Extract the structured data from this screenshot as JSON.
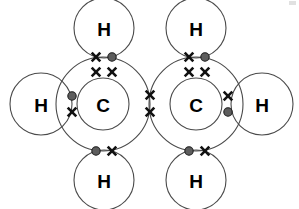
{
  "diagram": {
    "type": "dot-and-cross-covalent-bonding",
    "molecule_formula": "C2H4",
    "background_color": "#ffffff",
    "shell_stroke_color": "#4a4a4a",
    "dot_fill_color": "#5d5d5d",
    "dot_stroke_color": "#1c1c1c",
    "cross_color": "#111111",
    "label_color": "#000000",
    "atoms": [
      {
        "id": "h-top-left",
        "element": "H",
        "label": "H",
        "cx": 104,
        "cy": 28,
        "r": 30
      },
      {
        "id": "h-top-right",
        "element": "H",
        "label": "H",
        "cx": 196,
        "cy": 28,
        "r": 30
      },
      {
        "id": "h-left",
        "element": "H",
        "label": "H",
        "cx": 41,
        "cy": 104,
        "r": 31
      },
      {
        "id": "h-right",
        "element": "H",
        "label": "H",
        "cx": 262,
        "cy": 104,
        "r": 31
      },
      {
        "id": "h-bottom-left",
        "element": "H",
        "label": "H",
        "cx": 104,
        "cy": 180,
        "r": 30
      },
      {
        "id": "h-bottom-right",
        "element": "H",
        "label": "H",
        "cx": 196,
        "cy": 180,
        "r": 30
      },
      {
        "id": "c-left",
        "element": "C",
        "label": "C",
        "cx": 103,
        "cy": 104,
        "r": 47,
        "inner_r": 26
      },
      {
        "id": "c-right",
        "element": "C",
        "label": "C",
        "cx": 196,
        "cy": 104,
        "r": 47,
        "inner_r": 26
      }
    ],
    "electrons": [
      {
        "id": "e-top-left-cross",
        "kind": "cross",
        "x": 96,
        "y": 57,
        "bond": "c-left-h-top-left"
      },
      {
        "id": "e-top-left-dot",
        "kind": "dot",
        "x": 112,
        "y": 57,
        "bond": "c-left-h-top-left"
      },
      {
        "id": "e-top-right-cross",
        "kind": "cross",
        "x": 189,
        "y": 57,
        "bond": "c-right-h-top-right"
      },
      {
        "id": "e-top-right-dot",
        "kind": "dot",
        "x": 205,
        "y": 57,
        "bond": "c-right-h-top-right"
      },
      {
        "id": "e-left-dot",
        "kind": "dot",
        "x": 72,
        "y": 96,
        "bond": "c-left-h-left"
      },
      {
        "id": "e-left-cross",
        "kind": "cross",
        "x": 72,
        "y": 112,
        "bond": "c-left-h-left"
      },
      {
        "id": "e-right-cross",
        "kind": "cross",
        "x": 228,
        "y": 96,
        "bond": "c-right-h-right"
      },
      {
        "id": "e-right-dot",
        "kind": "dot",
        "x": 228,
        "y": 112,
        "bond": "c-right-h-right"
      },
      {
        "id": "e-bottom-left-dot",
        "kind": "dot",
        "x": 96,
        "y": 151,
        "bond": "c-left-h-bottom-left"
      },
      {
        "id": "e-bottom-left-cross",
        "kind": "cross",
        "x": 112,
        "y": 151,
        "bond": "c-left-h-bottom-left"
      },
      {
        "id": "e-bottom-right-dot",
        "kind": "dot",
        "x": 189,
        "y": 151,
        "bond": "c-right-h-bottom-right"
      },
      {
        "id": "e-bottom-right-cross",
        "kind": "cross",
        "x": 205,
        "y": 151,
        "bond": "c-right-h-bottom-right"
      },
      {
        "id": "e-cc-upper-cross",
        "kind": "cross",
        "x": 150,
        "y": 95,
        "bond": "c-left-c-right"
      },
      {
        "id": "e-cc-lower-cross",
        "kind": "cross",
        "x": 150,
        "y": 112,
        "bond": "c-left-c-right"
      },
      {
        "id": "e-inner-left-cross-a",
        "kind": "cross",
        "x": 96,
        "y": 72,
        "bond": "c-left-inner-pair"
      },
      {
        "id": "e-inner-left-cross-b",
        "kind": "cross",
        "x": 112,
        "y": 72,
        "bond": "c-left-inner-pair"
      },
      {
        "id": "e-inner-right-cross-a",
        "kind": "cross",
        "x": 189,
        "y": 72,
        "bond": "c-right-inner-pair"
      },
      {
        "id": "e-inner-right-cross-b",
        "kind": "cross",
        "x": 205,
        "y": 72,
        "bond": "c-right-inner-pair"
      }
    ]
  }
}
